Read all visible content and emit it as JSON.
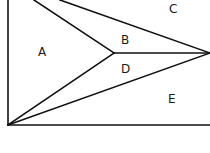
{
  "diagram": {
    "type": "geometric-partition",
    "vertices": {
      "bottom_left": [
        8,
        125
      ],
      "middle": [
        114,
        53
      ],
      "right": [
        210,
        53
      ],
      "top_a": [
        34,
        0
      ],
      "top_b": [
        60,
        0
      ]
    },
    "labels": [
      {
        "id": "A",
        "text": "A",
        "x": 43,
        "y": 56
      },
      {
        "id": "B",
        "text": "B",
        "x": 125,
        "y": 44
      },
      {
        "id": "C",
        "text": "C",
        "x": 173,
        "y": 13
      },
      {
        "id": "D",
        "text": "D",
        "x": 125,
        "y": 73
      },
      {
        "id": "E",
        "text": "E",
        "x": 172,
        "y": 103
      }
    ],
    "colors": {
      "line": "#111111",
      "background": "#ffffff",
      "text": "#1a1a1a"
    }
  }
}
